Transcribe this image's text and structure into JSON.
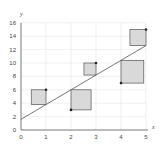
{
  "chart_data": {
    "type": "scatter",
    "title": "",
    "xlabel": "x",
    "ylabel": "y",
    "xlim": [
      0,
      5
    ],
    "ylim": [
      0,
      16
    ],
    "x_ticks": [
      "0",
      "1",
      "2",
      "3",
      "4",
      "5"
    ],
    "y_ticks": [
      "0",
      "2",
      "4",
      "6",
      "8",
      "10",
      "12",
      "14",
      "16"
    ],
    "grid": true,
    "points": [
      {
        "x": 1,
        "y": 6
      },
      {
        "x": 2,
        "y": 3
      },
      {
        "x": 3,
        "y": 10
      },
      {
        "x": 4,
        "y": 7
      },
      {
        "x": 5,
        "y": 15
      }
    ],
    "regression_line": {
      "intercept": 1.6,
      "slope": 2.2
    },
    "residual_squares": [
      {
        "x": 1,
        "residual": 2.2,
        "side": "left"
      },
      {
        "x": 2,
        "residual": -3.0,
        "side": "right"
      },
      {
        "x": 3,
        "residual": 1.8,
        "side": "left"
      },
      {
        "x": 4,
        "residual": -3.4,
        "side": "right"
      },
      {
        "x": 5,
        "residual": 2.4,
        "side": "left"
      }
    ],
    "colors": {
      "square_fill": "#d9d9d9",
      "square_stroke": "#555555",
      "line": "#555555",
      "point": "#222222",
      "grid": "#e6e6e6",
      "axis": "#555555"
    }
  }
}
